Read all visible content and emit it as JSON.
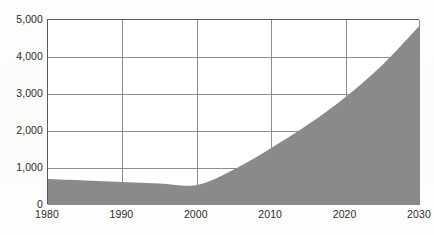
{
  "chart_data": {
    "type": "area",
    "title": "",
    "subtitle": "",
    "xlabel": "",
    "ylabel": "",
    "x": [
      1980,
      1985,
      1990,
      1995,
      2000,
      2005,
      2010,
      2015,
      2020,
      2025,
      2030
    ],
    "values": [
      700,
      660,
      620,
      580,
      540,
      960,
      1540,
      2180,
      2920,
      3800,
      4860
    ],
    "series": [
      {
        "name": "",
        "values": [
          700,
          660,
          620,
          580,
          540,
          960,
          1540,
          2180,
          2920,
          3800,
          4860
        ]
      }
    ],
    "xlim": [
      1980,
      2030
    ],
    "ylim": [
      0,
      5000
    ],
    "x_ticks": [
      1980,
      1990,
      2000,
      2010,
      2020,
      2030
    ],
    "x_tick_labels": [
      "1980",
      "1990",
      "2000",
      "2010",
      "2020",
      "2030"
    ],
    "y_ticks": [
      0,
      1000,
      2000,
      3000,
      4000,
      5000
    ],
    "y_tick_labels": [
      "0",
      "1,000",
      "2,000",
      "3,000",
      "4,000",
      "5,000"
    ],
    "grid": true,
    "legend": false,
    "legend_position": "none",
    "annotations": [],
    "colors": {
      "area_fill": "#8a8a8a",
      "gridline": "#8d8d8d",
      "axis": "#3f3f3f",
      "tick_label": "#2b2b2b",
      "plot_background": "#ffffff",
      "page_background": "#fdfdfc"
    }
  }
}
